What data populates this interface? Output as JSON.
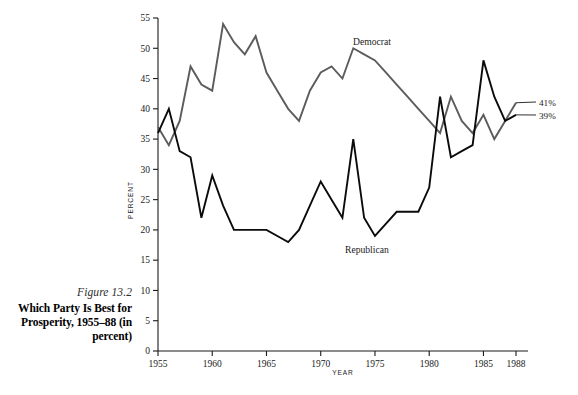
{
  "caption": {
    "figure_number": "Figure 13.2",
    "title_line1": "Which Party Is Best for",
    "title_line2": "Prosperity, 1955–88 (in",
    "title_line3": "percent)"
  },
  "annotations": {
    "democrat_label": "Democrat",
    "republican_label": "Republican",
    "democrat_end_value": "41%",
    "republican_end_value": "39%"
  },
  "colors": {
    "democrat_line": "#5c5c5c",
    "republican_line": "#0b0b0b",
    "axis": "#1a1a1a",
    "background": "#ffffff"
  },
  "chart_data": {
    "type": "line",
    "title": "Which Party Is Best for Prosperity, 1955–88 (in percent)",
    "xlabel": "YEAR",
    "ylabel": "PERCENT",
    "xlim": [
      1955,
      1988
    ],
    "ylim": [
      0,
      55
    ],
    "ytick_labels": [
      "0",
      "5",
      "10",
      "15",
      "20",
      "25",
      "30",
      "35",
      "40",
      "45",
      "50",
      "55"
    ],
    "yticks": [
      0,
      5,
      10,
      15,
      20,
      25,
      30,
      35,
      40,
      45,
      50,
      55
    ],
    "xtick_labels": [
      "1955",
      "1960",
      "1965",
      "1970",
      "1975",
      "1980",
      "1985",
      "1988"
    ],
    "xticks": [
      1955,
      1960,
      1965,
      1970,
      1975,
      1980,
      1985,
      1988
    ],
    "grid": false,
    "legend_position": "inline-annotation",
    "x": [
      1955,
      1956,
      1957,
      1958,
      1959,
      1960,
      1961,
      1962,
      1963,
      1964,
      1965,
      1966,
      1967,
      1968,
      1969,
      1970,
      1971,
      1972,
      1973,
      1974,
      1975,
      1976,
      1977,
      1978,
      1979,
      1980,
      1981,
      1982,
      1983,
      1984,
      1985,
      1986,
      1987,
      1988
    ],
    "series": [
      {
        "name": "Democrat",
        "color": "#5c5c5c",
        "end_value_label": "41%",
        "values": [
          37,
          34,
          38,
          47,
          44,
          43,
          54,
          51,
          49,
          52,
          46,
          43,
          40,
          38,
          43,
          46,
          47,
          45,
          50,
          49,
          48,
          46,
          44,
          42,
          40,
          38,
          36,
          42,
          38,
          36,
          39,
          35,
          38,
          41
        ]
      },
      {
        "name": "Republican",
        "color": "#0b0b0b",
        "end_value_label": "39%",
        "values": [
          36,
          40,
          33,
          32,
          22,
          29,
          24,
          20,
          20,
          20,
          20,
          19,
          18,
          20,
          24,
          28,
          25,
          22,
          35,
          22,
          19,
          21,
          23,
          23,
          23,
          27,
          42,
          32,
          33,
          34,
          48,
          42,
          38,
          39
        ]
      }
    ]
  }
}
